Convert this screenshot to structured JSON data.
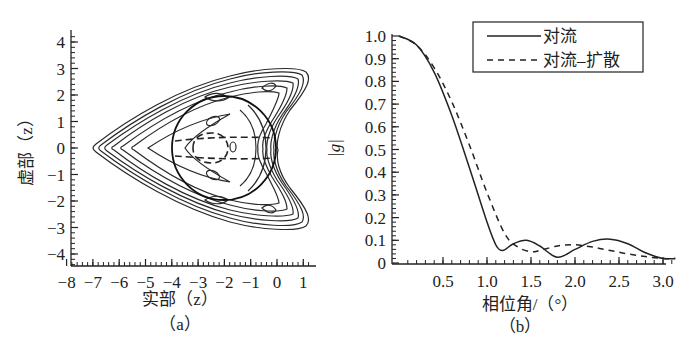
{
  "chart_data": [
    {
      "panel": "a",
      "caption": "（a）",
      "type": "contour",
      "title": "",
      "xlabel": "实部（z）",
      "ylabel": "虚部（z）",
      "xlim": [
        -8,
        1.5
      ],
      "ylim": [
        -4.5,
        4.5
      ],
      "xticks": [
        "-8",
        "-7",
        "-6",
        "-5",
        "-4",
        "-3",
        "-2",
        "-1",
        "0",
        "1"
      ],
      "yticks": [
        "4",
        "3",
        "2",
        "1",
        "0",
        "-1",
        "-2",
        "-3",
        "-4"
      ],
      "description": "Stability region contours shaped like an arrowhead pointing left (tip near x=-7.3, arms extending to x≈1 at y≈±3), a solid circle centered at (-2,0) radius 2, and a dashed contour band around y≈±0.4 inside the circle.",
      "circle": {
        "center": [
          -2,
          0
        ],
        "radius": 2
      }
    },
    {
      "panel": "b",
      "caption": "（b）",
      "type": "line",
      "title": "",
      "xlabel": "相位角/（°）",
      "ylabel": "|g|",
      "xlim": [
        0,
        3.14
      ],
      "ylim": [
        0,
        1.0
      ],
      "xticks": [
        "0.5",
        "1.0",
        "1.5",
        "2.0",
        "2.5",
        "3.0"
      ],
      "yticks": [
        "1.0",
        "0.9",
        "0.8",
        "0.7",
        "0.6",
        "0.5",
        "0.4",
        "0.3",
        "0.2",
        "0.1",
        "0"
      ],
      "legend": {
        "position": "upper right",
        "entries": [
          "对流",
          "对流–扩散"
        ]
      },
      "series": [
        {
          "name": "对流",
          "style": "solid",
          "x": [
            0,
            0.2,
            0.4,
            0.6,
            0.8,
            1.0,
            1.1,
            1.18,
            1.3,
            1.45,
            1.6,
            1.8,
            2.0,
            2.2,
            2.4,
            2.6,
            2.8,
            3.0,
            3.14
          ],
          "y": [
            1.0,
            0.96,
            0.84,
            0.65,
            0.42,
            0.18,
            0.08,
            0.055,
            0.085,
            0.1,
            0.075,
            0.025,
            0.06,
            0.095,
            0.105,
            0.085,
            0.045,
            0.02,
            0.02
          ]
        },
        {
          "name": "对流–扩散",
          "style": "dashed",
          "x": [
            0,
            0.2,
            0.4,
            0.6,
            0.8,
            1.0,
            1.2,
            1.35,
            1.5,
            1.6,
            1.8,
            2.0,
            2.2,
            2.4,
            2.6,
            2.8,
            3.0,
            3.14
          ],
          "y": [
            1.0,
            0.96,
            0.86,
            0.71,
            0.52,
            0.31,
            0.13,
            0.07,
            0.05,
            0.055,
            0.075,
            0.08,
            0.07,
            0.055,
            0.04,
            0.028,
            0.02,
            0.02
          ]
        }
      ]
    }
  ],
  "panel_a": {
    "caption": "（a）",
    "xlabel": "实部（z）",
    "ylabel": "虚部（z）",
    "xticks": [
      "-8",
      "-7",
      "-6",
      "-5",
      "-4",
      "-3",
      "-2",
      "-1",
      "0",
      "1"
    ],
    "yticks": [
      "4",
      "3",
      "2",
      "1",
      "0",
      "-1",
      "-2",
      "-3",
      "-4"
    ]
  },
  "panel_b": {
    "caption": "（b）",
    "xlabel": "相位角/（°）",
    "ylabel": "|g|",
    "xticks": [
      "0.5",
      "1.0",
      "1.5",
      "2.0",
      "2.5",
      "3.0"
    ],
    "yticks": [
      "1.0",
      "0.9",
      "0.8",
      "0.7",
      "0.6",
      "0.5",
      "0.4",
      "0.3",
      "0.2",
      "0.1",
      "0"
    ],
    "legend": [
      "对流",
      "对流–扩散"
    ]
  }
}
